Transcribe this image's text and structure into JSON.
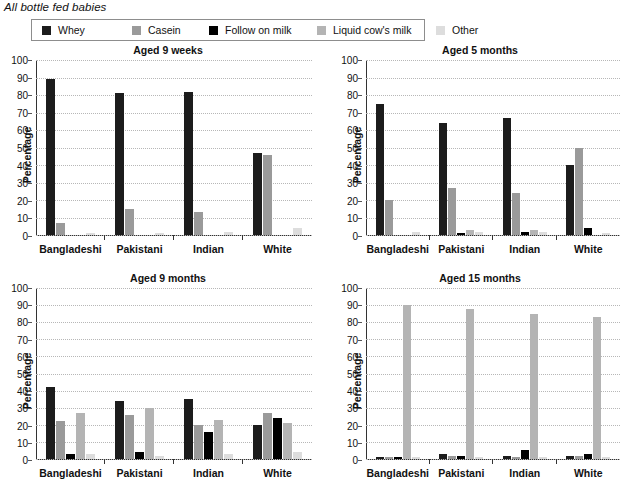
{
  "header": {
    "title": "All bottle fed babies"
  },
  "legend": {
    "items": [
      {
        "label": "Whey",
        "color": "#1c1c1c"
      },
      {
        "label": "Casein",
        "color": "#9a9a9a"
      },
      {
        "label": "Follow on milk",
        "color": "#000000"
      },
      {
        "label": "Liquid cow's milk",
        "color": "#b4b4b4"
      },
      {
        "label": "Other",
        "color": "#dddddd"
      }
    ]
  },
  "axis": {
    "ylabel": "Percentage",
    "ticks": [
      100,
      90,
      80,
      70,
      60,
      50,
      40,
      30,
      20,
      10,
      0
    ],
    "ymin": 0,
    "ymax": 100
  },
  "chart_data": [
    {
      "type": "bar",
      "title": "Aged 9 weeks",
      "xlabel": "",
      "ylabel": "Percentage",
      "ylim": [
        0,
        100
      ],
      "grid": true,
      "legend_position": "top",
      "categories": [
        "Bangladeshi",
        "Pakistani",
        "Indian",
        "White"
      ],
      "series": [
        {
          "name": "Whey",
          "color": "#1c1c1c",
          "values": [
            89,
            81,
            82,
            47
          ]
        },
        {
          "name": "Casein",
          "color": "#9a9a9a",
          "values": [
            7,
            15,
            13,
            46
          ]
        },
        {
          "name": "Follow on milk",
          "color": "#000000",
          "values": [
            0,
            0,
            0,
            0
          ]
        },
        {
          "name": "Liquid cow's milk",
          "color": "#b4b4b4",
          "values": [
            0,
            0,
            0,
            0
          ]
        },
        {
          "name": "Other",
          "color": "#dddddd",
          "values": [
            1,
            1,
            2,
            4
          ]
        }
      ]
    },
    {
      "type": "bar",
      "title": "Aged 5 months",
      "xlabel": "",
      "ylabel": "Percentage",
      "ylim": [
        0,
        100
      ],
      "grid": true,
      "legend_position": "top",
      "categories": [
        "Bangladeshi",
        "Pakistani",
        "Indian",
        "White"
      ],
      "series": [
        {
          "name": "Whey",
          "color": "#1c1c1c",
          "values": [
            75,
            64,
            67,
            40
          ]
        },
        {
          "name": "Casein",
          "color": "#9a9a9a",
          "values": [
            20,
            27,
            24,
            50
          ]
        },
        {
          "name": "Follow on milk",
          "color": "#000000",
          "values": [
            0,
            1,
            2,
            4
          ]
        },
        {
          "name": "Liquid cow's milk",
          "color": "#b4b4b4",
          "values": [
            0,
            3,
            3,
            0
          ]
        },
        {
          "name": "Other",
          "color": "#dddddd",
          "values": [
            2,
            2,
            2,
            1
          ]
        }
      ]
    },
    {
      "type": "bar",
      "title": "Aged 9 months",
      "xlabel": "",
      "ylabel": "Percentage",
      "ylim": [
        0,
        100
      ],
      "grid": true,
      "legend_position": "top",
      "categories": [
        "Bangladeshi",
        "Pakistani",
        "Indian",
        "White"
      ],
      "series": [
        {
          "name": "Whey",
          "color": "#1c1c1c",
          "values": [
            42,
            34,
            35,
            20
          ]
        },
        {
          "name": "Casein",
          "color": "#9a9a9a",
          "values": [
            22,
            26,
            20,
            27
          ]
        },
        {
          "name": "Follow on milk",
          "color": "#000000",
          "values": [
            3,
            4,
            16,
            24
          ]
        },
        {
          "name": "Liquid cow's milk",
          "color": "#b4b4b4",
          "values": [
            27,
            30,
            23,
            21
          ]
        },
        {
          "name": "Other",
          "color": "#dddddd",
          "values": [
            3,
            2,
            3,
            4
          ]
        }
      ]
    },
    {
      "type": "bar",
      "title": "Aged 15 months",
      "xlabel": "",
      "ylabel": "Percentage",
      "ylim": [
        0,
        100
      ],
      "grid": true,
      "legend_position": "top",
      "categories": [
        "Bangladeshi",
        "Pakistani",
        "Indian",
        "White"
      ],
      "series": [
        {
          "name": "Whey",
          "color": "#1c1c1c",
          "values": [
            1,
            3,
            2,
            2
          ]
        },
        {
          "name": "Casein",
          "color": "#9a9a9a",
          "values": [
            1,
            2,
            1,
            2
          ]
        },
        {
          "name": "Follow on milk",
          "color": "#000000",
          "values": [
            1,
            2,
            5,
            3
          ]
        },
        {
          "name": "Liquid cow's milk",
          "color": "#b4b4b4",
          "values": [
            90,
            88,
            85,
            83
          ]
        },
        {
          "name": "Other",
          "color": "#dddddd",
          "values": [
            1,
            1,
            1,
            1
          ]
        }
      ]
    }
  ]
}
